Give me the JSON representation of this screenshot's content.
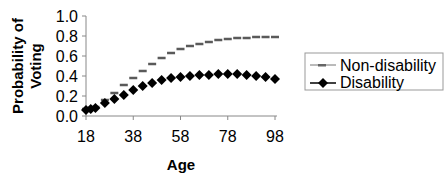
{
  "chart_data": {
    "type": "scatter",
    "title": "",
    "xlabel": "Age",
    "ylabel": "Probability of Voting",
    "ylabel_lines": [
      "Probability of",
      "Voting"
    ],
    "xlim": [
      18,
      98
    ],
    "ylim": [
      0,
      1
    ],
    "xticks": [
      18,
      38,
      58,
      78,
      98
    ],
    "yticks": [
      0.0,
      0.2,
      0.4,
      0.6,
      0.8,
      1.0
    ],
    "ytick_labels": [
      "0.0",
      "0.2",
      "0.4",
      "0.6",
      "0.8",
      "1.0"
    ],
    "grid": false,
    "legend_position": "right",
    "series": [
      {
        "name": "Non-disability",
        "marker": "dash",
        "color": "#5a5a5a",
        "x": [
          18,
          20,
          22,
          26,
          30,
          34,
          38,
          42,
          46,
          50,
          54,
          58,
          62,
          66,
          70,
          74,
          78,
          82,
          86,
          90,
          94,
          98
        ],
        "values": [
          0.07,
          0.08,
          0.09,
          0.16,
          0.23,
          0.31,
          0.38,
          0.45,
          0.52,
          0.58,
          0.63,
          0.67,
          0.7,
          0.72,
          0.74,
          0.76,
          0.77,
          0.78,
          0.78,
          0.79,
          0.79,
          0.79
        ]
      },
      {
        "name": "Disability",
        "marker": "diamond",
        "color": "#000000",
        "x": [
          18,
          20,
          22,
          26,
          30,
          34,
          38,
          42,
          46,
          50,
          54,
          58,
          62,
          66,
          70,
          74,
          78,
          82,
          86,
          90,
          94,
          98
        ],
        "values": [
          0.06,
          0.07,
          0.08,
          0.13,
          0.17,
          0.21,
          0.26,
          0.3,
          0.33,
          0.36,
          0.38,
          0.39,
          0.4,
          0.41,
          0.41,
          0.42,
          0.42,
          0.42,
          0.41,
          0.4,
          0.39,
          0.37
        ]
      }
    ]
  },
  "legend": {
    "items": [
      {
        "label": "Non-disability"
      },
      {
        "label": "Disability"
      }
    ]
  }
}
